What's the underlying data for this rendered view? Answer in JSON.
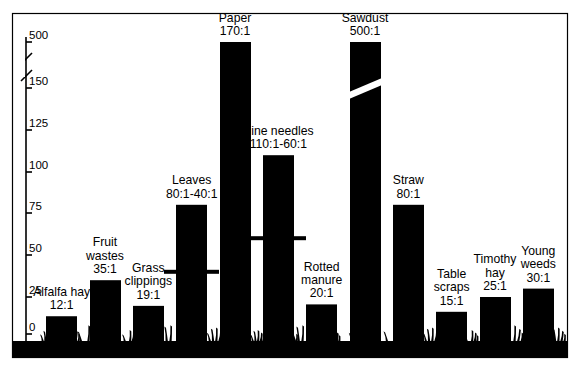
{
  "figure": {
    "background": "#ffffff",
    "ink": "#000000",
    "frame": {
      "x": 12,
      "y": 13,
      "width": 555,
      "height": 344
    }
  },
  "chart_data": {
    "type": "bar",
    "title": "",
    "subtitle": "",
    "xlabel": "",
    "ylabel": "",
    "grid": false,
    "legend": false,
    "axis_break": {
      "present": true,
      "between": [
        150,
        500
      ],
      "symbol": "double-slash"
    },
    "ylim": [
      0,
      500
    ],
    "yticks": [
      0,
      25,
      50,
      75,
      100,
      125,
      150,
      500
    ],
    "ytick_labels": [
      "0",
      "25",
      "50",
      "75",
      "100",
      "125",
      "150",
      "500"
    ],
    "categories": [
      "Alfalfa hay",
      "Fruit wastes",
      "Grass clippings",
      "Leaves",
      "Paper",
      "Pine needles",
      "Rotted manure",
      "Sawdust",
      "Straw",
      "Table scraps",
      "Timothy hay",
      "Young weeds"
    ],
    "values": [
      12,
      35,
      19,
      80,
      170,
      110,
      20,
      500,
      80,
      15,
      25,
      30
    ],
    "range_low": [
      null,
      null,
      null,
      40,
      null,
      60,
      null,
      null,
      null,
      null,
      null,
      null
    ],
    "bars": [
      {
        "name": "Alfalfa hay",
        "label_lines": [
          "Alfalfa hay",
          "12:1"
        ],
        "ratio": "12:1",
        "value": 12,
        "range": null,
        "broken": false
      },
      {
        "name": "Fruit wastes",
        "label_lines": [
          "Fruit",
          "wastes",
          "35:1"
        ],
        "ratio": "35:1",
        "value": 35,
        "range": null,
        "broken": false
      },
      {
        "name": "Grass clippings",
        "label_lines": [
          "Grass",
          "clippings",
          "19:1"
        ],
        "ratio": "19:1",
        "value": 19,
        "range": null,
        "broken": false
      },
      {
        "name": "Leaves",
        "label_lines": [
          "Leaves",
          "80:1-40:1"
        ],
        "ratio": "80:1-40:1",
        "value": 80,
        "range": [
          40,
          80
        ],
        "broken": false
      },
      {
        "name": "Paper",
        "label_lines": [
          "Paper",
          "170:1"
        ],
        "ratio": "170:1",
        "value": 170,
        "range": null,
        "broken": false
      },
      {
        "name": "Pine needles",
        "label_lines": [
          "Pine needles",
          "110:1-60:1"
        ],
        "ratio": "110:1-60:1",
        "value": 110,
        "range": [
          60,
          110
        ],
        "broken": false
      },
      {
        "name": "Rotted manure",
        "label_lines": [
          "Rotted",
          "manure",
          "20:1"
        ],
        "ratio": "20:1",
        "value": 20,
        "range": null,
        "broken": false
      },
      {
        "name": "Sawdust",
        "label_lines": [
          "Sawdust",
          "500:1"
        ],
        "ratio": "500:1",
        "value": 500,
        "range": null,
        "broken": true
      },
      {
        "name": "Straw",
        "label_lines": [
          "Straw",
          "80:1"
        ],
        "ratio": "80:1",
        "value": 80,
        "range": null,
        "broken": false
      },
      {
        "name": "Table scraps",
        "label_lines": [
          "Table",
          "scraps",
          "15:1"
        ],
        "ratio": "15:1",
        "value": 15,
        "range": null,
        "broken": false
      },
      {
        "name": "Timothy hay",
        "label_lines": [
          "Timothy",
          "hay",
          "25:1"
        ],
        "ratio": "25:1",
        "value": 25,
        "range": null,
        "broken": false
      },
      {
        "name": "Young weeds",
        "label_lines": [
          "Young",
          "weeds",
          "30:1"
        ],
        "ratio": "30:1",
        "value": 30,
        "range": null,
        "broken": false
      }
    ]
  },
  "geometry": {
    "baseline_y": 341,
    "ground_bottom_y": 357,
    "tick_y": {
      "0": 334,
      "25": 297,
      "50": 255,
      "75": 213,
      "100": 172,
      "125": 130,
      "150": 88,
      "500": 42
    },
    "break_y": [
      55,
      72
    ],
    "bars_px": [
      {
        "x": 92,
        "w": 30,
        "top": 313
      },
      {
        "x": 144,
        "w": 30,
        "top": 283
      },
      {
        "x": 196,
        "w": 28,
        "top": 303
      },
      {
        "x": 182,
        "w": 0,
        "top": 0
      }
    ]
  }
}
